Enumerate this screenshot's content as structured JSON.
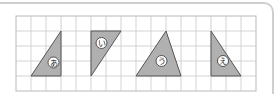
{
  "figure": {
    "grid": {
      "columns": 16,
      "rows": 5
    },
    "triangles": [
      {
        "label": "あ",
        "vertices": [
          [
            1,
            4
          ],
          [
            3,
            1
          ],
          [
            3,
            4
          ]
        ]
      },
      {
        "label": "い",
        "vertices": [
          [
            5,
            1
          ],
          [
            7,
            1
          ],
          [
            5,
            4
          ]
        ]
      },
      {
        "label": "う",
        "vertices": [
          [
            8,
            4
          ],
          [
            10,
            1
          ],
          [
            11,
            4
          ]
        ]
      },
      {
        "label": "え",
        "vertices": [
          [
            13,
            1
          ],
          [
            13,
            4
          ],
          [
            15,
            4
          ]
        ]
      }
    ],
    "label_positions": [
      [
        2.5,
        3.1
      ],
      [
        5.7,
        1.8
      ],
      [
        9.7,
        3.0
      ],
      [
        13.8,
        3.0
      ]
    ],
    "colors": {
      "fill": "#b0b0b0",
      "stroke": "#555555",
      "grid": "#c8c8c8"
    }
  }
}
